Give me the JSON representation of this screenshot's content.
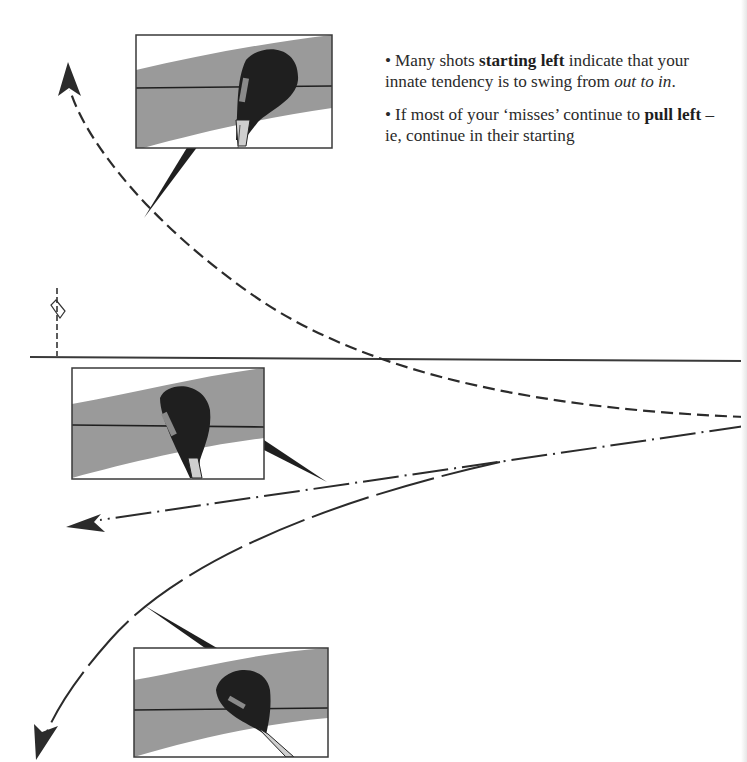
{
  "diagram": {
    "target_line": {
      "label": "target line",
      "color": "#3a3a3a"
    },
    "flag": {
      "label": "pin flag"
    },
    "paths": [
      {
        "id": "slice",
        "style": "dashed",
        "description": "starts left then curves right across the target line",
        "arrow": "top-left"
      },
      {
        "id": "pull",
        "style": "dash-dot",
        "description": "straight pull left",
        "arrow": "left"
      },
      {
        "id": "pull-hook",
        "style": "long-dash",
        "description": "starts left and curves further left",
        "arrow": "bottom-left"
      }
    ],
    "insets": [
      {
        "id": "clubface-open",
        "description": "clubface open to path (top)"
      },
      {
        "id": "clubface-square",
        "description": "clubface square to path (middle)"
      },
      {
        "id": "clubface-closed",
        "description": "clubface closed to path (bottom)"
      }
    ],
    "colors": {
      "line": "#2b2b2b",
      "band": "#9a9a9a",
      "club": "#1f1f1f",
      "frame": "#3a3a3a"
    }
  },
  "text": {
    "para1": {
      "bullet": "•",
      "pre": "Many shots ",
      "bold": "starting left",
      "mid": " indicate that your innate tendency is to swing from ",
      "italic": "out to in",
      "post": "."
    },
    "para2": {
      "bullet": "•",
      "pre": "If most of your ‘misses’ continue to ",
      "bold": "pull left",
      "post": " – ie, continue in their starting"
    }
  }
}
